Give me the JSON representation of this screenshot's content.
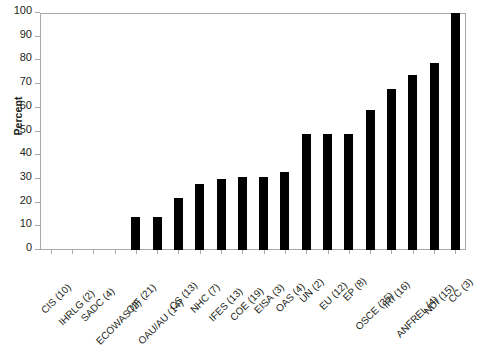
{
  "chart_data": {
    "type": "bar",
    "title": "",
    "subtitle": "",
    "xlabel": "",
    "ylabel": "Percent",
    "ylim": [
      0,
      100
    ],
    "yticks": [
      0,
      10,
      20,
      30,
      40,
      50,
      60,
      70,
      80,
      90,
      100
    ],
    "ytick_labels": [
      "0",
      "10",
      "20",
      "30",
      "40",
      "50",
      "60",
      "70",
      "80",
      "90",
      "100"
    ],
    "grid": false,
    "legend": null,
    "bar_color": "#000000",
    "frame_color": "#a7a9ac",
    "categories": [
      "CIS (10)",
      "IHRLG (2)",
      "SADC (4)",
      "ECOWAS (2)",
      "OIF (21)",
      "OAU/AU (14)",
      "CS (13)",
      "NHC (7)",
      "IFES (13)",
      "COE (19)",
      "EISA (3)",
      "OAS (4)",
      "UN (2)",
      "EU (12)",
      "EP (8)",
      "OSCE (35)",
      "IRI (16)",
      "ANFREL (4)",
      "NDI (15)",
      "CC (3)"
    ],
    "values": [
      0,
      0,
      0,
      0,
      14,
      14,
      22,
      28,
      30,
      31,
      31,
      33,
      49,
      49,
      49,
      59,
      68,
      74,
      79,
      100
    ]
  }
}
